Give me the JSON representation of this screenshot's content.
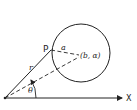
{
  "diagram": {
    "labels": {
      "point": "P",
      "radius_small": "a",
      "center": "(b, α)",
      "radius_polar": "r",
      "angle": "θ",
      "axis": "X"
    },
    "colors": {
      "stroke": "#222222",
      "background": "#ffffff"
    }
  }
}
